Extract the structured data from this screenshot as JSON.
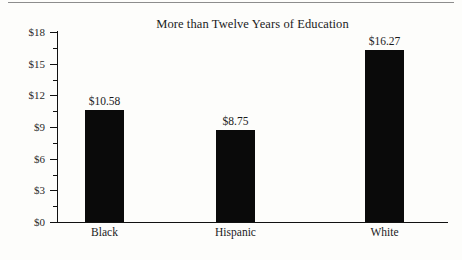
{
  "chart_data": {
    "type": "bar",
    "title": "More than Twelve Years of Education",
    "xlabel": "",
    "ylabel": "",
    "categories": [
      "Black",
      "Hispanic",
      "White"
    ],
    "values": [
      10.58,
      8.75,
      16.27
    ],
    "value_labels": [
      "$10.58",
      "$8.75",
      "$16.27"
    ],
    "ylim": [
      0,
      18
    ],
    "ytick_labels": [
      "$0",
      "$3",
      "$6",
      "$9",
      "$12",
      "$15",
      "$18"
    ],
    "ytick_values": [
      0,
      3,
      6,
      9,
      12,
      15,
      18
    ],
    "yminor_values": [
      1.5,
      4.5,
      7.5,
      10.5,
      13.5,
      16.5
    ],
    "grid": false,
    "legend": null,
    "bar_color": "#0a0a0a",
    "axis_color": "#111111",
    "background_color": "#fdfdfb"
  }
}
